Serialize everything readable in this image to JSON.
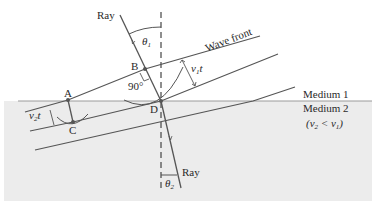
{
  "figure": {
    "colors": {
      "medium2_fill": "#ececec",
      "line": "#555555",
      "interface": "#9a9a9a"
    },
    "labels": {
      "incident_ray": "Ray",
      "refracted_ray": "Ray",
      "wave_front": "Wave front",
      "theta1": "θ",
      "theta1_sub": "1",
      "theta2": "θ",
      "theta2_sub": "2",
      "point_a": "A",
      "point_b": "B",
      "point_c": "C",
      "point_d": "D",
      "right_angle": "90°",
      "v1t": "v",
      "v1t_sub": "1",
      "v1t_t": "t",
      "v2t": "v",
      "v2t_sub": "2",
      "v2t_t": "t",
      "medium1": "Medium 1",
      "medium2": "Medium 2",
      "condition_open": "(v",
      "condition_sub2": "2",
      "condition_mid": " < v",
      "condition_sub1": "1",
      "condition_close": ")"
    }
  }
}
